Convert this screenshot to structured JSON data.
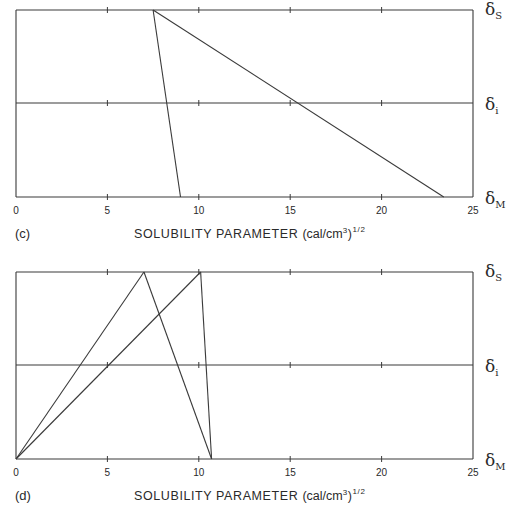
{
  "chart_data": [
    {
      "type": "line",
      "panel_label": "(c)",
      "xlabel": "SOLUBILITY PARAMETER",
      "xlabel_units": "(cal/cm",
      "xlabel_units_sup1": "3",
      "xlabel_units_close": ")",
      "xlabel_units_sup2": "1/2",
      "xlim": [
        0,
        25
      ],
      "xticks": [
        0,
        5,
        10,
        15,
        20,
        25
      ],
      "xtick_labels": [
        "0",
        "5",
        "10",
        "15",
        "20",
        "25"
      ],
      "levels": [
        {
          "symbol": "δ",
          "subscript": "S",
          "name": "solvent"
        },
        {
          "symbol": "δ",
          "subscript": "i",
          "name": "interface"
        },
        {
          "symbol": "δ",
          "subscript": "M",
          "name": "medium"
        }
      ],
      "segments": [
        {
          "from": {
            "level": "S",
            "x": 7.5
          },
          "to": {
            "level": "M",
            "x": 9.0
          }
        },
        {
          "from": {
            "level": "S",
            "x": 7.5
          },
          "to": {
            "level": "M",
            "x": 23.4
          }
        }
      ],
      "grid": false
    },
    {
      "type": "line",
      "panel_label": "(d)",
      "xlabel": "SOLUBILITY PARAMETER",
      "xlabel_units": "(cal/cm",
      "xlabel_units_sup1": "3",
      "xlabel_units_close": ")",
      "xlabel_units_sup2": "1/2",
      "xlim": [
        0,
        25
      ],
      "xticks": [
        0,
        5,
        10,
        15,
        20,
        25
      ],
      "xtick_labels": [
        "0",
        "5",
        "10",
        "15",
        "20",
        "25"
      ],
      "levels": [
        {
          "symbol": "δ",
          "subscript": "S",
          "name": "solvent"
        },
        {
          "symbol": "δ",
          "subscript": "i",
          "name": "interface"
        },
        {
          "symbol": "δ",
          "subscript": "M",
          "name": "medium"
        }
      ],
      "segments": [
        {
          "from": {
            "level": "M",
            "x": 0
          },
          "to": {
            "level": "S",
            "x": 7.0
          }
        },
        {
          "from": {
            "level": "S",
            "x": 7.0
          },
          "to": {
            "level": "M",
            "x": 10.7
          }
        },
        {
          "from": {
            "level": "M",
            "x": 0
          },
          "to": {
            "level": "S",
            "x": 10.1
          }
        },
        {
          "from": {
            "level": "S",
            "x": 10.1
          },
          "to": {
            "level": "M",
            "x": 10.7
          }
        }
      ],
      "grid": false
    }
  ],
  "colors": {
    "line": "#3a3a3a",
    "text": "#2a2a2a",
    "background": "#ffffff"
  }
}
